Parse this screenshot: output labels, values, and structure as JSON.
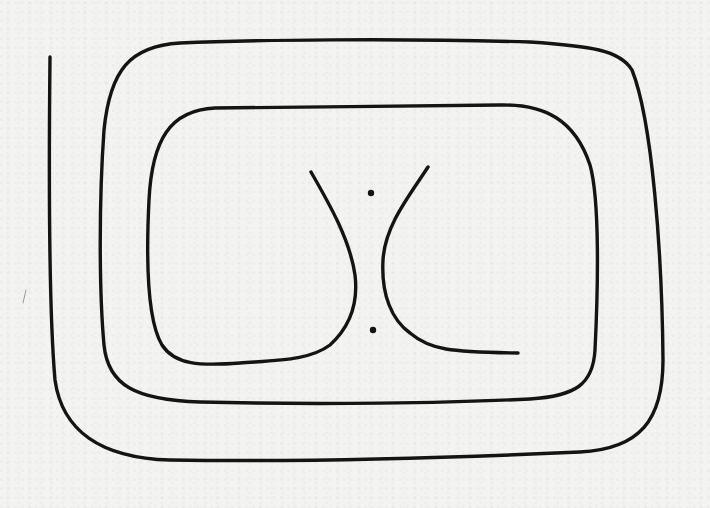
{
  "diagram": {
    "type": "hand-drawn contour diagram",
    "colors": {
      "background": "#f3f3f1",
      "ink": "#141414"
    },
    "elements": {
      "spiral": {
        "label": "",
        "path": "M50,57 C49,150 48,300 55,380 C62,430 100,458 170,460 C300,462 450,458 580,452 C640,449 663,420 663,360 C662,250 652,120 632,70 C620,50 590,46 530,42 C400,38 250,40 180,43 C130,46 110,70 104,130 C99,200 99,290 104,345 C108,385 135,400 200,402 C320,405 450,403 530,399 C575,396 593,385 595,350 C598,290 600,200 590,165 C575,120 545,104 500,105 C420,106 300,107 215,108 C170,110 152,140 149,200 C146,260 147,320 162,345 C175,365 200,366 240,363 C280,360 310,360 330,345 C352,325 358,300 355,275 C350,240 330,205 311,172"
      },
      "hyperbola_right_branch": {
        "label": "",
        "path": "M428,167 C410,195 385,225 383,260 C381,295 392,320 410,333 C430,350 450,352 518,353"
      },
      "points": [
        {
          "name": "upper-point",
          "cx": 371,
          "cy": 193,
          "r": 3.2
        },
        {
          "name": "lower-point",
          "cx": 373,
          "cy": 330,
          "r": 3.2
        }
      ],
      "stray_mark": {
        "path": "M26,290 L23,303"
      }
    },
    "text": []
  }
}
